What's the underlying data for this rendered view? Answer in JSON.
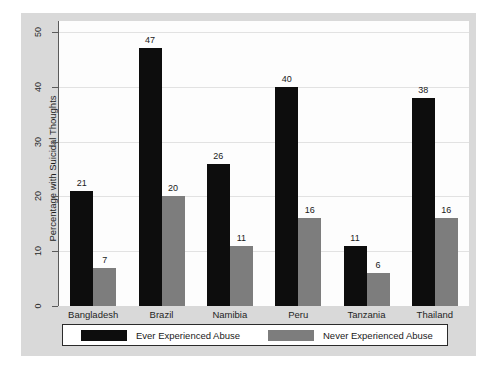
{
  "chart_data": {
    "type": "bar",
    "title": "",
    "subtitle": "",
    "xlabel": "",
    "ylabel": "Percentage with Suicidal Thoughts",
    "ylim": [
      0,
      52
    ],
    "yticks": [
      0,
      10,
      20,
      30,
      40,
      50
    ],
    "ytick_labels": [
      "0",
      "10",
      "20",
      "30",
      "40",
      "50"
    ],
    "grid": true,
    "legend_position": "bottom",
    "categories": [
      "Bangladesh",
      "Brazil",
      "Namibia",
      "Peru",
      "Tanzania",
      "Thailand"
    ],
    "series": [
      {
        "name": "Ever Experienced Abuse",
        "color": "#0d0d0d",
        "values": [
          21,
          47,
          26,
          40,
          11,
          38
        ],
        "labels": [
          "21",
          "47",
          "26",
          "40",
          "11",
          "38"
        ]
      },
      {
        "name": "Never Experienced Abuse",
        "color": "#7d7d7d",
        "values": [
          7,
          20,
          11,
          16,
          6,
          16
        ],
        "labels": [
          "7",
          "20",
          "11",
          "16",
          "6",
          "16"
        ]
      }
    ]
  },
  "legend": {
    "entries": [
      {
        "label": "Ever Experienced Abuse",
        "swatch": "black-swatch"
      },
      {
        "label": "Never Experienced Abuse",
        "swatch": "gray-swatch"
      }
    ]
  },
  "colors": {
    "page_background": "#ffffff",
    "figure_panel": "#d9d9d9",
    "plot_background": "#fdfdfd",
    "axis": "#5a5a5a",
    "gridline": "#e2e2e2",
    "series_ever": "#0d0d0d",
    "series_never": "#7d7d7d",
    "text": "#1f1f1f"
  }
}
